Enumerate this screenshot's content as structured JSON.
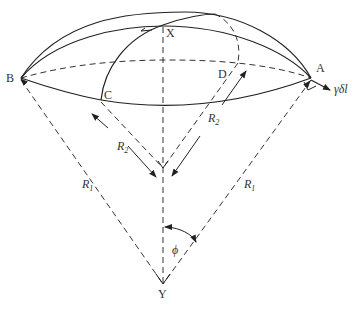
{
  "diagram": {
    "points": {
      "A": {
        "label": "A",
        "x": 311,
        "y": 78
      },
      "B": {
        "label": "B",
        "x": 21,
        "y": 78
      },
      "C": {
        "label": "C",
        "x": 101,
        "y": 100
      },
      "D": {
        "label": "D",
        "x": 238,
        "y": 62
      },
      "X": {
        "label": "X",
        "x": 163,
        "y": 25
      },
      "Y": {
        "label": "Y",
        "x": 163,
        "y": 284
      }
    },
    "labels": {
      "R1_left": "R",
      "R1_left_sub": "1",
      "R1_right": "R",
      "R1_right_sub": "1",
      "R2_left": "R",
      "R2_left_sub": "2",
      "R2_right": "R",
      "R2_right_sub": "2",
      "phi": "ϕ",
      "force": "γδl"
    },
    "colors": {
      "stroke": "#222222",
      "text": "#333333",
      "background": "#ffffff"
    }
  }
}
